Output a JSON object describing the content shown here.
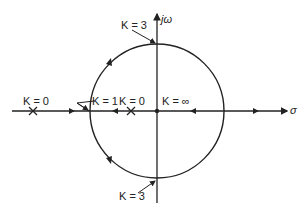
{
  "diagram": {
    "type": "root-locus",
    "axes": {
      "real_label": "σ",
      "imag_label": "jω"
    },
    "labels": {
      "k0_left": "K = 0",
      "k1": "K = 1",
      "k0_right": "K = 0",
      "kinf": "K = ∞",
      "k3_top": "K = 3",
      "k3_bottom": "K = 3"
    },
    "ink_color": "#222222"
  }
}
